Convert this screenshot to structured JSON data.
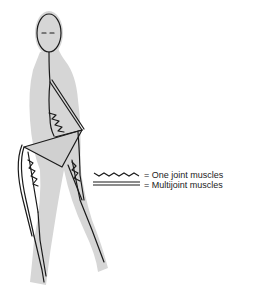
{
  "figure": {
    "colors": {
      "silhouette": "#d4d4d4",
      "line": "#1a1a1a",
      "background": "#ffffff"
    }
  },
  "legend": {
    "items": [
      {
        "symbol": "wavy-line",
        "label": "= One joint muscles"
      },
      {
        "symbol": "double-line",
        "label": "= Multijoint muscles"
      }
    ]
  }
}
